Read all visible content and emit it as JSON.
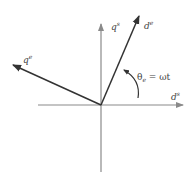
{
  "diagram": {
    "axes": {
      "stationary_d": {
        "label": "d",
        "sup": "s"
      },
      "stationary_q": {
        "label": "q",
        "sup": "s"
      },
      "rotating_d": {
        "label": "d",
        "sup": "e"
      },
      "rotating_q": {
        "label": "q",
        "sup": "e"
      }
    },
    "angle": {
      "symbol": "θ",
      "sub": "e",
      "rhs": " = ωt"
    },
    "colors": {
      "stationary_axis": "#8a8a8a",
      "rotating_axis": "#333333"
    }
  }
}
